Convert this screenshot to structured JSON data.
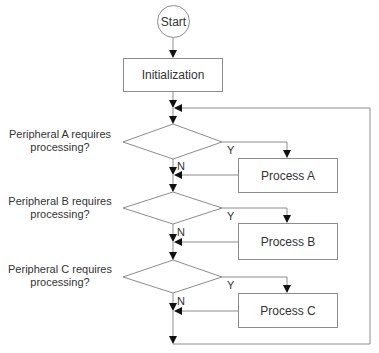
{
  "diagram": {
    "type": "flowchart",
    "start": {
      "label": "Start"
    },
    "init": {
      "label": "Initialization"
    },
    "decisions": [
      {
        "line1": "Peripheral A requires",
        "line2": "processing?",
        "yes": "Y",
        "no": "N"
      },
      {
        "line1": "Peripheral B requires",
        "line2": "processing?",
        "yes": "Y",
        "no": "N"
      },
      {
        "line1": "Peripheral C requires",
        "line2": "processing?",
        "yes": "Y",
        "no": "N"
      }
    ],
    "processes": [
      {
        "label": "Process A"
      },
      {
        "label": "Process B"
      },
      {
        "label": "Process C"
      }
    ],
    "colors": {
      "line": "#8c8c8c",
      "arrow": "#111111",
      "text": "#333333"
    }
  }
}
